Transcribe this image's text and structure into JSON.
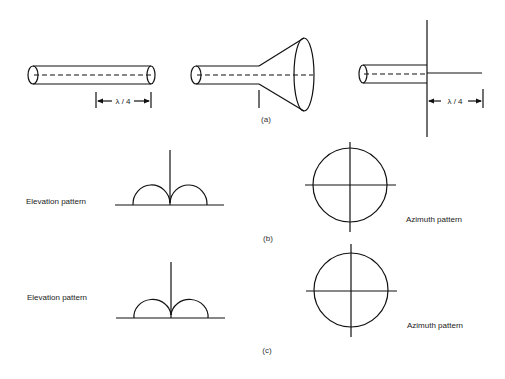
{
  "figure": {
    "part_a": {
      "caption": "(a)",
      "antennas": [
        {
          "name": "open-ended coaxial line",
          "dimension_label": "λ / 4"
        },
        {
          "name": "horn antenna"
        },
        {
          "name": "monopole with ground plane",
          "dimension_label": "λ / 4"
        }
      ]
    },
    "part_b": {
      "caption": "(b)",
      "elevation_label": "Elevation pattern",
      "azimuth_label": "Azimuth pattern"
    },
    "part_c": {
      "caption": "(c)",
      "elevation_label": "Elevation pattern",
      "azimuth_label": "Azimuth pattern"
    }
  }
}
